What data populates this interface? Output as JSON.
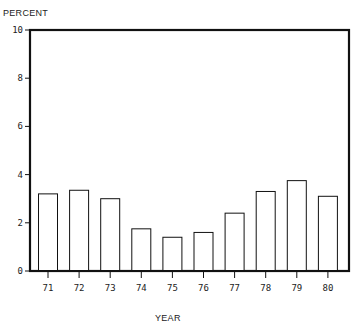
{
  "chart_data": {
    "type": "bar",
    "title": "",
    "xlabel": "YEAR",
    "ylabel": "PERCENT",
    "categories": [
      "71",
      "72",
      "73",
      "74",
      "75",
      "76",
      "77",
      "78",
      "79",
      "80"
    ],
    "values": [
      3.2,
      3.35,
      3.0,
      1.75,
      1.4,
      1.6,
      2.4,
      3.3,
      3.75,
      3.1
    ],
    "ylim": [
      0,
      10
    ],
    "yticks": [
      0,
      2,
      4,
      6,
      8,
      10
    ],
    "ytick_labels": [
      "0",
      "2",
      "4",
      "6",
      "8",
      "10"
    ],
    "grid": false,
    "legend": null,
    "colors": {
      "bar_fill": "#ffffff",
      "bar_stroke": "#111111",
      "axis": "#111111"
    }
  },
  "labels": {
    "y_axis": "PERCENT",
    "x_axis": "YEAR"
  }
}
